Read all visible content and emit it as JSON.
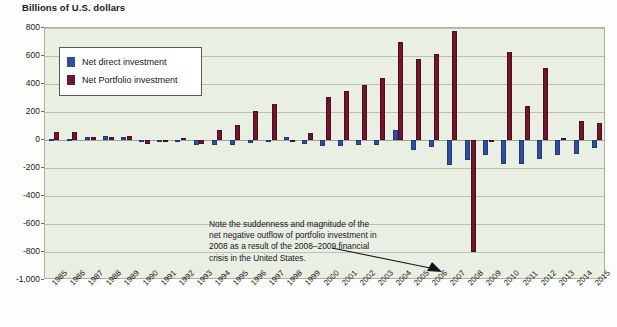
{
  "chart_data": {
    "type": "bar",
    "title": "Billions of U.S. dollars",
    "xlabel": "",
    "ylabel": "Billions of U.S. dollars",
    "ylim": [
      -1000,
      800
    ],
    "yticks": [
      800,
      600,
      400,
      200,
      0,
      -200,
      -400,
      -600,
      -800,
      -1000
    ],
    "ytick_labels": [
      "800",
      "600",
      "400",
      "200",
      "0",
      "-200",
      "-400",
      "-600",
      "-800",
      "-1,000"
    ],
    "grid": true,
    "legend_position": "upper-left-inside",
    "categories": [
      "1985",
      "1986",
      "1987",
      "1988",
      "1989",
      "1990",
      "1991",
      "1992",
      "1993",
      "1994",
      "1995",
      "1996",
      "1997",
      "1998",
      "1999",
      "2000",
      "2001",
      "2002",
      "2003",
      "2004",
      "2005",
      "2006",
      "2007",
      "2008",
      "2009",
      "2010",
      "2011",
      "2012",
      "2013",
      "2014",
      "2015"
    ],
    "series": [
      {
        "name": "Net direct investment",
        "color": "#2f4f9c",
        "values": [
          6,
          8,
          23,
          26,
          25,
          -14,
          -5,
          -12,
          -33,
          -36,
          -35,
          -20,
          -8,
          18,
          -27,
          -45,
          -40,
          -35,
          -38,
          75,
          -70,
          -50,
          -180,
          -140,
          -110,
          -170,
          -170,
          -135,
          -110,
          -100,
          -60
        ]
      },
      {
        "name": "Net Portfolio investment",
        "color": "#70162f",
        "values": [
          54,
          57,
          22,
          22,
          29,
          -26,
          -5,
          14,
          -25,
          70,
          108,
          210,
          260,
          -6,
          48,
          310,
          350,
          390,
          440,
          700,
          580,
          615,
          780,
          -800,
          0,
          630,
          245,
          515,
          15,
          135,
          120
        ]
      }
    ],
    "annotation": {
      "lines": [
        "Note the suddenness and magnitude of the",
        "net negative outflow of portfolio investment in",
        "2008 as a result of the 2008–2009 financial",
        "crisis in the United States."
      ],
      "target_category": "2008",
      "target_series": "Net Portfolio investment"
    }
  },
  "legend": {
    "items": [
      {
        "label": "Net direct investment"
      },
      {
        "label": "Net Portfolio investment"
      }
    ]
  }
}
